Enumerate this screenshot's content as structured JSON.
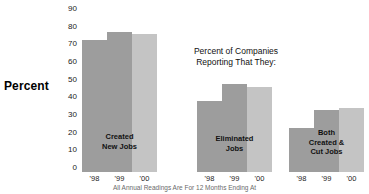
{
  "chart_data": {
    "type": "bar",
    "title": "Percent of Companies Reporting That They:",
    "title_line_1": "Percent of Companies",
    "title_line_2": "Reporting That They:",
    "xlabel": "",
    "ylabel": "Percent",
    "ylim": [
      0,
      90
    ],
    "grid": false,
    "legend_position": "none",
    "categories": [
      "'98",
      "'99",
      "'00"
    ],
    "groups": [
      {
        "name": "Created New Jobs",
        "caption_line_1": "Created",
        "caption_line_2": "New Jobs",
        "caption_line_3": "",
        "values": [
          75,
          79,
          78
        ]
      },
      {
        "name": "Eliminated Jobs",
        "caption_line_1": "Eliminated",
        "caption_line_2": "Jobs",
        "caption_line_3": "",
        "values": [
          40,
          50,
          48
        ]
      },
      {
        "name": "Both Created & Cut Jobs",
        "caption_line_1": "Both",
        "caption_line_2": "Created &",
        "caption_line_3": "Cut Jobs",
        "values": [
          25,
          35,
          36
        ]
      }
    ],
    "series": [
      {
        "name": "'98",
        "values": [
          75,
          40,
          25
        ]
      },
      {
        "name": "'99",
        "values": [
          79,
          50,
          35
        ]
      },
      {
        "name": "'00",
        "values": [
          78,
          48,
          36
        ]
      }
    ],
    "yticks": [
      90,
      80,
      70,
      60,
      50,
      40,
      30,
      20,
      10,
      0
    ],
    "colors": {
      "bar_dark": "#9d9d9d",
      "bar_light": "#c4c4c4",
      "text": "#111111",
      "background": "#ffffff"
    }
  },
  "footnote": "All Annual Readings Are For 12 Months Ending At"
}
